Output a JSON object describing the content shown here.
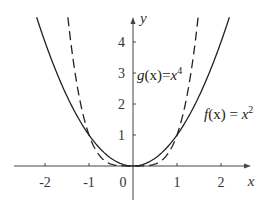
{
  "chart_data": {
    "type": "line",
    "title": "",
    "xlabel": "x",
    "ylabel": "y",
    "xlim": [
      -2.7,
      2.6
    ],
    "ylim": [
      -0.9,
      4.8
    ],
    "x_ticks": [
      -2,
      -1,
      0,
      1,
      2
    ],
    "x_tick_labels": [
      "-2",
      "-1",
      "0",
      "1",
      "2"
    ],
    "y_ticks": [
      1,
      2,
      3,
      4
    ],
    "y_tick_labels": [
      "1",
      "2",
      "3",
      "4"
    ],
    "grid": false,
    "legend": "none",
    "series": [
      {
        "name": "f(x) = x^2",
        "style": "solid",
        "expression": "x^2",
        "x": [
          -2.19,
          -2,
          -1.5,
          -1,
          -0.5,
          0,
          0.5,
          1,
          1.5,
          2,
          2.19
        ],
        "values": [
          4.8,
          4,
          2.25,
          1,
          0.25,
          0,
          0.25,
          1,
          2.25,
          4,
          4.8
        ]
      },
      {
        "name": "g(x) = x^4",
        "style": "dashed",
        "expression": "x^4",
        "x": [
          -1.48,
          -1.25,
          -1,
          -0.75,
          -0.5,
          0,
          0.5,
          0.75,
          1,
          1.25,
          1.48
        ],
        "values": [
          4.8,
          2.44,
          1,
          0.32,
          0.06,
          0,
          0.06,
          0.32,
          1,
          2.44,
          4.8
        ]
      }
    ],
    "annotations": [
      {
        "text": "g(x)=x^4",
        "x": 0.1,
        "y": 3.1
      },
      {
        "text": "f(x)=x^2",
        "x": 1.7,
        "y": 1.7
      }
    ]
  },
  "labels": {
    "x_axis": "x",
    "y_axis": "y",
    "x_ticks": [
      "-2",
      "-1",
      "0",
      "1",
      "2"
    ],
    "y_ticks": [
      "1",
      "2",
      "3",
      "4"
    ],
    "g_name": "g",
    "g_arg": "(x)",
    "g_eq": "=",
    "g_var": "x",
    "g_exp": "4",
    "f_name": "f",
    "f_arg": "(x)",
    "f_eq": " = ",
    "f_var": "x",
    "f_exp": "2"
  },
  "colors": {
    "axis": "#444444",
    "curve": "#222222"
  }
}
